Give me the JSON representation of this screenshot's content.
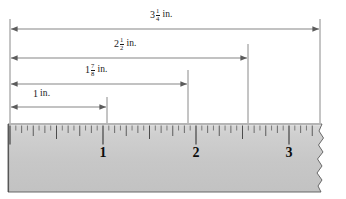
{
  "figure": {
    "caption": "(Actual size, in inches)",
    "line_color": "#6b6b6b",
    "text_color": "#1a1a1a",
    "ruler_fill": "#c9c9c9",
    "ruler_edge": "#4a4a4a",
    "background": "#ffffff"
  },
  "measurements": [
    {
      "id": "m-3-1-4",
      "label": "3 1/4 in.",
      "whole": "3",
      "numerator": "1",
      "denominator": "4",
      "unit": "in.",
      "value_inches": 3.25,
      "arrow_y": 29,
      "label_x": 167,
      "label_y": 13,
      "x_start": 10,
      "x_end": 320
    },
    {
      "id": "m-2-1-2",
      "label": "2 1/2 in.",
      "whole": "2",
      "numerator": "1",
      "denominator": "2",
      "unit": "in.",
      "value_inches": 2.5,
      "arrow_y": 58,
      "label_x": 131,
      "label_y": 42,
      "x_start": 10,
      "x_end": 248
    },
    {
      "id": "m-1-7-8",
      "label": "1 7/8 in.",
      "whole": "1",
      "numerator": "7",
      "denominator": "8",
      "unit": "in.",
      "value_inches": 1.875,
      "arrow_y": 84,
      "label_x": 101,
      "label_y": 68,
      "x_start": 10,
      "x_end": 188
    },
    {
      "id": "m-1",
      "label": "1 in.",
      "whole": "1",
      "numerator": "",
      "denominator": "",
      "unit": "in.",
      "value_inches": 1.0,
      "arrow_y": 107,
      "label_x": 44,
      "label_y": 93,
      "x_start": 10,
      "x_end": 107
    }
  ],
  "leader_lines": [
    {
      "id": "leader-0",
      "x": 10,
      "y_top": 19,
      "y_bottom": 122
    },
    {
      "id": "leader-1-in",
      "x": 107,
      "y_top": 97,
      "y_bottom": 122
    },
    {
      "id": "leader-1-7-8",
      "x": 188,
      "y_top": 70,
      "y_bottom": 122
    },
    {
      "id": "leader-2-1-2",
      "x": 248,
      "y_top": 44,
      "y_bottom": 122
    },
    {
      "id": "leader-3-1-4",
      "x": 320,
      "y_top": 19,
      "y_bottom": 122
    }
  ],
  "ruler": {
    "x_left": 10,
    "x_zero": 10,
    "inch_px": 93,
    "y_top": 124,
    "y_bottom": 192,
    "scale_label": "(Actual size, in inches)",
    "caption_x": 168,
    "caption_y": 171,
    "subdivisions_per_inch": 16,
    "tick_numbers": [
      {
        "value": "1",
        "x": 103,
        "y": 146
      },
      {
        "value": "2",
        "x": 196,
        "y": 146
      },
      {
        "value": "3",
        "x": 289,
        "y": 146
      }
    ],
    "torn_right_edge": true
  },
  "chart_data": {
    "type": "bar",
    "xlabel": "inches",
    "ylabel": "",
    "categories": [
      "1 in.",
      "1 7/8 in.",
      "2 1/2 in.",
      "3 1/4 in."
    ],
    "values": [
      1.0,
      1.875,
      2.5,
      3.25
    ],
    "xlim": [
      0,
      3.5
    ],
    "grid": false,
    "legend": "none",
    "annotations": [
      "(Actual size, in inches)"
    ]
  }
}
